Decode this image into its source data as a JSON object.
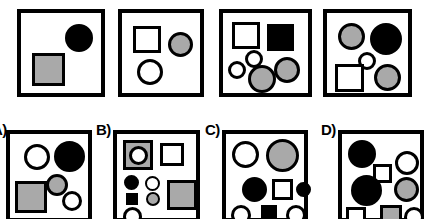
{
  "figure": {
    "background_color": "#ffffff",
    "outline_color": "#000000",
    "gray_color": "#a9a9a9",
    "black_color": "#000000",
    "white_color": "#ffffff"
  },
  "labels": {
    "a": "A)",
    "b": "B)",
    "c": "C)",
    "d": "D)"
  },
  "top_row": [
    {
      "name": "sample-panel-1",
      "box": {
        "x": 17,
        "y": 9,
        "w": 88,
        "h": 88
      },
      "shapes": [
        {
          "kind": "circle",
          "fill": "black",
          "x": 44,
          "y": 11,
          "w": 28,
          "h": 28
        },
        {
          "kind": "square",
          "fill": "gray",
          "x": 11,
          "y": 40,
          "w": 33,
          "h": 33
        }
      ]
    },
    {
      "name": "sample-panel-2",
      "box": {
        "x": 118,
        "y": 9,
        "w": 86,
        "h": 88
      },
      "shapes": [
        {
          "kind": "square",
          "fill": "white",
          "x": 11,
          "y": 13,
          "w": 28,
          "h": 27
        },
        {
          "kind": "circle",
          "fill": "gray",
          "x": 46,
          "y": 19,
          "w": 25,
          "h": 25
        },
        {
          "kind": "circle",
          "fill": "white",
          "x": 15,
          "y": 46,
          "w": 26,
          "h": 26
        }
      ]
    },
    {
      "name": "sample-panel-3",
      "box": {
        "x": 219,
        "y": 9,
        "w": 93,
        "h": 88
      },
      "shapes": [
        {
          "kind": "square",
          "fill": "white",
          "x": 9,
          "y": 9,
          "w": 28,
          "h": 27
        },
        {
          "kind": "square",
          "fill": "black",
          "x": 44,
          "y": 11,
          "w": 27,
          "h": 27
        },
        {
          "kind": "circle",
          "fill": "white",
          "x": 22,
          "y": 37,
          "w": 18,
          "h": 18
        },
        {
          "kind": "circle",
          "fill": "white",
          "x": 5,
          "y": 48,
          "w": 18,
          "h": 18
        },
        {
          "kind": "circle",
          "fill": "gray",
          "x": 51,
          "y": 44,
          "w": 26,
          "h": 26
        },
        {
          "kind": "circle",
          "fill": "gray",
          "x": 25,
          "y": 52,
          "w": 28,
          "h": 28
        }
      ]
    },
    {
      "name": "sample-panel-4",
      "box": {
        "x": 323,
        "y": 9,
        "w": 89,
        "h": 88
      },
      "shapes": [
        {
          "kind": "circle",
          "fill": "gray",
          "x": 11,
          "y": 10,
          "w": 27,
          "h": 27
        },
        {
          "kind": "circle",
          "fill": "black",
          "x": 43,
          "y": 10,
          "w": 32,
          "h": 32
        },
        {
          "kind": "circle",
          "fill": "white",
          "x": 31,
          "y": 39,
          "w": 18,
          "h": 18
        },
        {
          "kind": "square",
          "fill": "white",
          "x": 8,
          "y": 51,
          "w": 29,
          "h": 28
        },
        {
          "kind": "circle",
          "fill": "gray",
          "x": 47,
          "y": 51,
          "w": 27,
          "h": 27
        }
      ]
    }
  ],
  "bottom_row": [
    {
      "name": "choice-panel-a",
      "label_key": "a",
      "label_pos": {
        "x": -8,
        "y": 122
      },
      "box": {
        "x": 6,
        "y": 130,
        "w": 86,
        "h": 92
      },
      "shapes": [
        {
          "kind": "circle",
          "fill": "white",
          "x": 14,
          "y": 10,
          "w": 26,
          "h": 26
        },
        {
          "kind": "circle",
          "fill": "black",
          "x": 44,
          "y": 7,
          "w": 31,
          "h": 31
        },
        {
          "kind": "circle",
          "fill": "gray",
          "x": 36,
          "y": 40,
          "w": 22,
          "h": 22
        },
        {
          "kind": "square",
          "fill": "gray",
          "x": 5,
          "y": 47,
          "w": 32,
          "h": 32
        },
        {
          "kind": "circle",
          "fill": "white",
          "x": 52,
          "y": 57,
          "w": 20,
          "h": 20
        }
      ]
    },
    {
      "name": "choice-panel-b",
      "label_key": "b",
      "label_pos": {
        "x": 96,
        "y": 122
      },
      "box": {
        "x": 113,
        "y": 130,
        "w": 87,
        "h": 92
      },
      "shapes": [
        {
          "kind": "square",
          "fill": "gray",
          "x": 6,
          "y": 6,
          "w": 30,
          "h": 30
        },
        {
          "kind": "circle",
          "fill": "white",
          "x": 12,
          "y": 12,
          "w": 19,
          "h": 19
        },
        {
          "kind": "square",
          "fill": "white",
          "x": 43,
          "y": 9,
          "w": 24,
          "h": 23
        },
        {
          "kind": "circle",
          "fill": "black",
          "x": 7,
          "y": 41,
          "w": 15,
          "h": 15
        },
        {
          "kind": "circle",
          "fill": "white",
          "x": 28,
          "y": 42,
          "w": 15,
          "h": 15
        },
        {
          "kind": "square",
          "fill": "black",
          "x": 9,
          "y": 59,
          "w": 12,
          "h": 12
        },
        {
          "kind": "circle",
          "fill": "gray",
          "x": 29,
          "y": 58,
          "w": 14,
          "h": 14
        },
        {
          "kind": "square",
          "fill": "gray",
          "x": 50,
          "y": 46,
          "w": 30,
          "h": 30
        },
        {
          "kind": "circle",
          "fill": "white",
          "x": 6,
          "y": 73,
          "w": 19,
          "h": 19
        }
      ]
    },
    {
      "name": "choice-panel-c",
      "label_key": "c",
      "label_pos": {
        "x": 205,
        "y": 122
      },
      "box": {
        "x": 222,
        "y": 130,
        "w": 86,
        "h": 92
      },
      "shapes": [
        {
          "kind": "circle",
          "fill": "white",
          "x": 6,
          "y": 7,
          "w": 27,
          "h": 27
        },
        {
          "kind": "circle",
          "fill": "gray",
          "x": 40,
          "y": 5,
          "w": 33,
          "h": 33
        },
        {
          "kind": "circle",
          "fill": "black",
          "x": 16,
          "y": 43,
          "w": 25,
          "h": 25
        },
        {
          "kind": "square",
          "fill": "white",
          "x": 46,
          "y": 45,
          "w": 21,
          "h": 21
        },
        {
          "kind": "circle",
          "fill": "black",
          "x": 70,
          "y": 48,
          "w": 15,
          "h": 15
        },
        {
          "kind": "circle",
          "fill": "white",
          "x": 5,
          "y": 71,
          "w": 20,
          "h": 20
        },
        {
          "kind": "square",
          "fill": "black",
          "x": 35,
          "y": 71,
          "w": 16,
          "h": 16
        },
        {
          "kind": "circle",
          "fill": "white",
          "x": 60,
          "y": 71,
          "w": 20,
          "h": 20
        }
      ]
    },
    {
      "name": "choice-panel-d",
      "label_key": "d",
      "label_pos": {
        "x": 321,
        "y": 122
      },
      "box": {
        "x": 338,
        "y": 130,
        "w": 86,
        "h": 92
      },
      "shapes": [
        {
          "kind": "circle",
          "fill": "black",
          "x": 6,
          "y": 6,
          "w": 28,
          "h": 28
        },
        {
          "kind": "square",
          "fill": "white",
          "x": 31,
          "y": 30,
          "w": 19,
          "h": 19
        },
        {
          "kind": "circle",
          "fill": "white",
          "x": 53,
          "y": 17,
          "w": 24,
          "h": 24
        },
        {
          "kind": "circle",
          "fill": "black",
          "x": 9,
          "y": 41,
          "w": 31,
          "h": 31
        },
        {
          "kind": "circle",
          "fill": "gray",
          "x": 52,
          "y": 43,
          "w": 25,
          "h": 25
        },
        {
          "kind": "square",
          "fill": "white",
          "x": 4,
          "y": 73,
          "w": 20,
          "h": 20
        },
        {
          "kind": "square",
          "fill": "gray",
          "x": 38,
          "y": 71,
          "w": 22,
          "h": 22
        },
        {
          "kind": "circle",
          "fill": "white",
          "x": 62,
          "y": 73,
          "w": 20,
          "h": 20
        }
      ]
    }
  ]
}
